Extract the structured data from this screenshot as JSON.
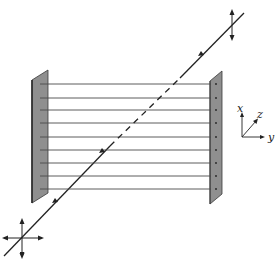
{
  "diagram": {
    "axes": {
      "x_label": "x",
      "y_label": "y",
      "z_label": "z"
    },
    "wire_count": 9,
    "colors": {
      "plate_fill": "#8f8f8f",
      "plate_edge": "#3a3a3a",
      "line": "#2a2a2a",
      "wire": "#4a4a4a",
      "background": "#ffffff"
    },
    "incident_polarization": "unpolarized (x and y components)",
    "transmitted_polarization": "x only"
  }
}
